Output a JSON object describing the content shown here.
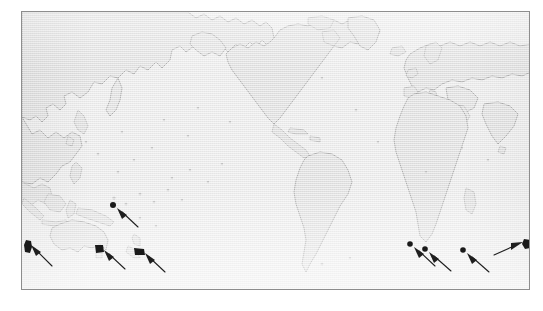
{
  "figure": {
    "kind": "world-map-figure",
    "projection": "pacific-centered equirectangular",
    "frame": {
      "x": 21,
      "y": 11,
      "width": 509,
      "height": 279,
      "border_color": "#8d8d8d"
    },
    "colors": {
      "ocean": "#ebebeb",
      "land_fill": "#e0e0e0",
      "coastline": "#9a9a9a",
      "marker": "#1a1a1a",
      "arrow": "#1f1f1f",
      "page_background": "#ffffff"
    }
  },
  "map": {
    "landmasses": [
      {
        "name": "asia-russia"
      },
      {
        "name": "japan"
      },
      {
        "name": "southeast-asia"
      },
      {
        "name": "indonesia-new-guinea"
      },
      {
        "name": "australia"
      },
      {
        "name": "tasmania"
      },
      {
        "name": "new-zealand"
      },
      {
        "name": "north-america"
      },
      {
        "name": "greenland"
      },
      {
        "name": "central-america-caribbean"
      },
      {
        "name": "south-america"
      },
      {
        "name": "europe"
      },
      {
        "name": "africa"
      },
      {
        "name": "madagascar"
      },
      {
        "name": "middle-east-india"
      },
      {
        "name": "arctic-islands"
      },
      {
        "name": "pacific-islands"
      }
    ]
  },
  "annotations": {
    "count": 8,
    "description": "black point markers with arrows indicating sampling localities",
    "markers": [
      {
        "id": "marker-1",
        "name": "marker-southern-ocean-west",
        "x": 27,
        "y": 243,
        "shape": "blob",
        "arrow_from": {
          "x": 52,
          "y": 264
        }
      },
      {
        "id": "marker-2",
        "name": "marker-southwest-pacific",
        "x": 112,
        "y": 205,
        "shape": "dot",
        "arrow_from": {
          "x": 137,
          "y": 226
        }
      },
      {
        "id": "marker-3",
        "name": "marker-tasmania",
        "x": 98,
        "y": 247,
        "shape": "blob",
        "arrow_from": {
          "x": 124,
          "y": 268
        }
      },
      {
        "id": "marker-4",
        "name": "marker-new-zealand-south",
        "x": 138,
        "y": 250,
        "shape": "blob",
        "arrow_from": {
          "x": 164,
          "y": 271
        }
      },
      {
        "id": "marker-5",
        "name": "marker-indian-ocean-west",
        "x": 409,
        "y": 244,
        "shape": "dot",
        "arrow_from": {
          "x": 434,
          "y": 265
        }
      },
      {
        "id": "marker-6",
        "name": "marker-indian-ocean-central",
        "x": 424,
        "y": 248,
        "shape": "dot",
        "arrow_from": {
          "x": 450,
          "y": 269
        }
      },
      {
        "id": "marker-7",
        "name": "marker-indian-ocean-east",
        "x": 462,
        "y": 249,
        "shape": "dot",
        "arrow_from": {
          "x": 488,
          "y": 270
        }
      },
      {
        "id": "marker-8",
        "name": "marker-southern-ocean-east",
        "x": 527,
        "y": 243,
        "shape": "blob",
        "arrow_from": {
          "x": 500,
          "y": 254
        }
      }
    ]
  }
}
